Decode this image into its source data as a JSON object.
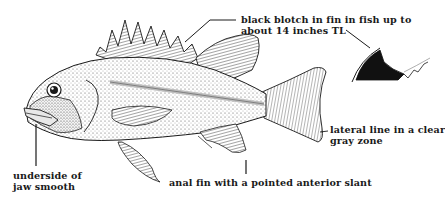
{
  "figure": {
    "colors": {
      "ink": "#1a1a1a",
      "stipple": "#7a7a7a",
      "background": "#ffffff",
      "blotch": "#111111"
    }
  },
  "annotations": {
    "blotch": {
      "line1": "black blotch in fin in fish up to",
      "line2": "about 14 inches TL"
    },
    "lateral_line": {
      "line1": "lateral line in a clear",
      "line2": "gray zone"
    },
    "jaw": {
      "line1": "underside of",
      "line2": "jaw smooth"
    },
    "anal_fin": {
      "line1": "anal fin with a pointed anterior slant"
    }
  }
}
